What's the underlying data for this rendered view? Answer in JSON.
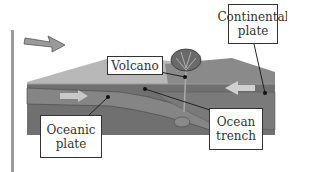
{
  "diagram": {
    "labels": {
      "continental_plate": "Continental\nplate",
      "volcano": "Volcano",
      "oceanic_plate": "Oceanic\nplate",
      "ocean_trench": "Ocean\ntrench"
    },
    "arrows": [
      {
        "name": "incoming-arrow",
        "direction": "down-right"
      },
      {
        "name": "oceanic-plate-motion-arrow",
        "direction": "right"
      },
      {
        "name": "continental-plate-motion-arrow",
        "direction": "left"
      }
    ],
    "colors": {
      "surface_light": "#b5b5b5",
      "block_mid": "#7d7d7d",
      "block_dark": "#5e5e5e",
      "arrow_fill": "#c8c8c8"
    }
  }
}
